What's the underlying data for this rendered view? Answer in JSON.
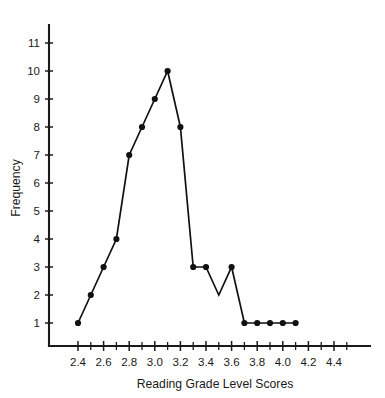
{
  "chart_data": {
    "type": "line",
    "title": "",
    "subtitle": "",
    "xlabel": "Reading Grade Level Scores",
    "ylabel": "Frequency",
    "x": [
      2.4,
      2.5,
      2.6,
      2.7,
      2.8,
      2.9,
      3.0,
      3.1,
      3.2,
      3.3,
      3.4,
      3.5,
      3.6,
      3.7,
      3.8,
      3.9,
      4.0,
      4.1
    ],
    "values": [
      1,
      2,
      3,
      4,
      7,
      8,
      9,
      10,
      8,
      3,
      3,
      2,
      3,
      1,
      1,
      1,
      1,
      1
    ],
    "markers": [
      true,
      true,
      true,
      true,
      true,
      true,
      true,
      true,
      true,
      true,
      true,
      false,
      true,
      true,
      true,
      true,
      true,
      true
    ],
    "series": [
      {
        "name": "Frequency",
        "values": [
          1,
          2,
          3,
          4,
          7,
          8,
          9,
          10,
          8,
          3,
          3,
          2,
          3,
          1,
          1,
          1,
          1,
          1
        ]
      }
    ],
    "xlim": [
      2.3,
      4.55
    ],
    "ylim": [
      0,
      12
    ],
    "xticks": [
      2.4,
      2.6,
      2.8,
      3.0,
      3.2,
      3.4,
      3.6,
      3.8,
      4.0,
      4.2,
      4.4
    ],
    "xticklabels": [
      "2.4",
      "2.6",
      "2.8",
      "3.0",
      "3.2",
      "3.4",
      "3.6",
      "3.8",
      "4.0",
      "4.2",
      "4.4"
    ],
    "xticks_minor": [
      2.5,
      2.7,
      2.9,
      3.1,
      3.3,
      3.5,
      3.7,
      3.9,
      4.1,
      4.3,
      4.5
    ],
    "yticks": [
      1,
      2,
      3,
      4,
      5,
      6,
      7,
      8,
      9,
      10,
      11
    ],
    "yticklabels": [
      "1",
      "2",
      "3",
      "4",
      "5",
      "6",
      "7",
      "8",
      "9",
      "10",
      "11"
    ],
    "grid": false,
    "legend": null,
    "legend_position": "none",
    "line_color": "#111111",
    "marker_color": "#111111",
    "axis_color": "#1a1a1a",
    "background_color": "#ffffff"
  }
}
